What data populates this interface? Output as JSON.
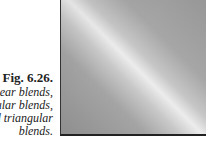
{
  "caption": {
    "figure_label": "Fig. 6.26.",
    "lines": [
      "near blends,",
      "angular blends,",
      "and triangular",
      "blends."
    ]
  },
  "figure": {
    "colors": {
      "base": "#9a9a9a",
      "highlight": "#ececec",
      "border": "#222222"
    }
  }
}
